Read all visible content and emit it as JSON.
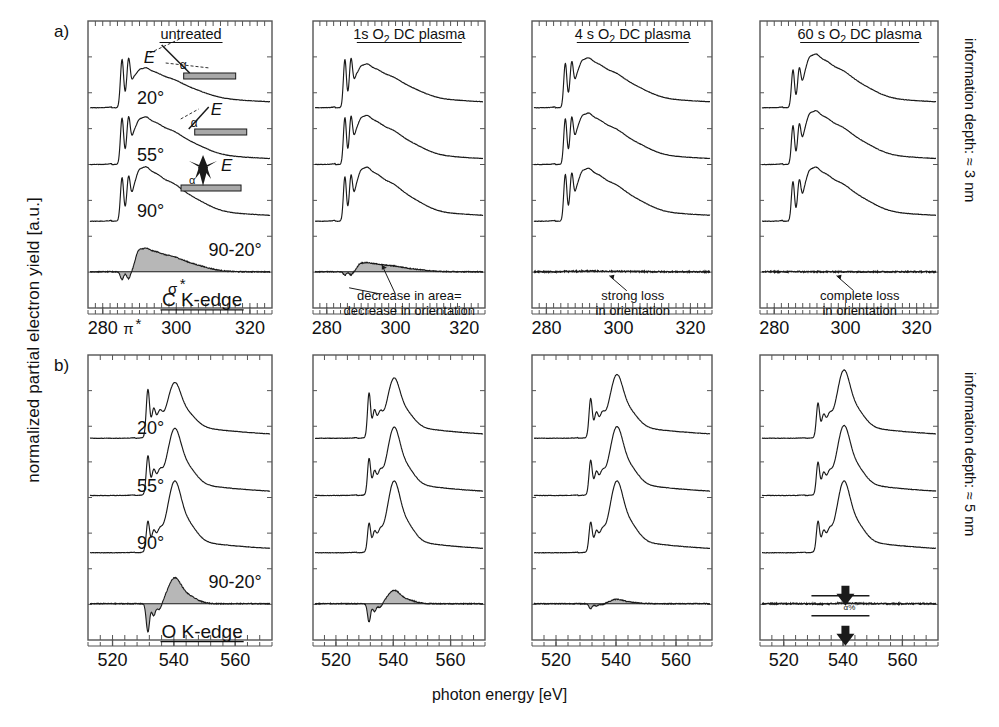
{
  "figure": {
    "ylabel": "normalized partial electron yield [a.u.]",
    "xlabel": "photon energy [eV]",
    "row_labels": {
      "a": "a)",
      "b": "b)"
    },
    "side_labels": {
      "row_a": "information depth: ≈ 3 nm",
      "row_b": "information depth: ≈ 5 nm"
    }
  },
  "chart_data": {
    "type": "line",
    "xlabel": "photon energy [eV]",
    "ylabel": "normalized partial electron yield [a.u.]",
    "grid": false,
    "legend": "none",
    "rows": [
      {
        "id": "a",
        "label": "a)",
        "edge": "C K-edge",
        "information_depth": "information depth: ≈ 3 nm",
        "xlim": [
          276,
          326
        ],
        "xticks": [
          280,
          300,
          320
        ],
        "xticklabels": [
          "280",
          "300",
          "320"
        ],
        "traces_per_panel": [
          "20°",
          "55°",
          "90°",
          "90-20°"
        ],
        "peak_labels": [
          "π*",
          "σ*"
        ],
        "panels": [
          {
            "title": "untreated",
            "title_parts": [
              {
                "t": "untreated",
                "sub": false
              }
            ],
            "annotation": "",
            "annotation_lines": [],
            "has_geometry_insets": true,
            "difference_area": "large"
          },
          {
            "title": "1s O2 DC plasma",
            "title_parts": [
              {
                "t": "1s O",
                "sub": false
              },
              {
                "t": "2",
                "sub": true
              },
              {
                "t": " DC plasma",
                "sub": false
              }
            ],
            "annotation": "decrease in area= decrease in orientation",
            "annotation_lines": [
              "decrease in area=",
              "decrease in orientation"
            ],
            "has_geometry_insets": false,
            "difference_area": "medium"
          },
          {
            "title": "4 s O2 DC plasma",
            "title_parts": [
              {
                "t": "4 s O",
                "sub": false
              },
              {
                "t": "2",
                "sub": true
              },
              {
                "t": " DC plasma",
                "sub": false
              }
            ],
            "annotation": "strong loss in orientation",
            "annotation_lines": [
              "strong loss",
              "in orientation"
            ],
            "has_geometry_insets": false,
            "difference_area": "small"
          },
          {
            "title": "60 s O2 DC plasma",
            "title_parts": [
              {
                "t": "60 s O",
                "sub": false
              },
              {
                "t": "2",
                "sub": true
              },
              {
                "t": " DC plasma",
                "sub": false
              }
            ],
            "annotation": "complete loss in orientation",
            "annotation_lines": [
              "complete loss",
              "in orientation"
            ],
            "has_geometry_insets": false,
            "difference_area": "none"
          }
        ]
      },
      {
        "id": "b",
        "label": "b)",
        "edge": "O K-edge",
        "information_depth": "information depth: ≈ 5 nm",
        "xlim": [
          512,
          572
        ],
        "xticks": [
          520,
          540,
          560
        ],
        "xticklabels": [
          "520",
          "540",
          "560"
        ],
        "traces_per_panel": [
          "20°",
          "55°",
          "90°",
          "90-20°"
        ],
        "peak_labels": [],
        "panels": [
          {
            "title": "untreated",
            "annotation": "",
            "annotation_lines": [],
            "difference_area": "large"
          },
          {
            "title": "1s O2 DC plasma",
            "annotation": "",
            "annotation_lines": [],
            "difference_area": "medium"
          },
          {
            "title": "4 s O2 DC plasma",
            "annotation": "",
            "annotation_lines": [],
            "difference_area": "small"
          },
          {
            "title": "60 s O2 DC plasma",
            "annotation": "",
            "annotation_lines": [],
            "difference_area": "tiny",
            "has_arrow_markers": true
          }
        ]
      }
    ],
    "geometry_insets": [
      {
        "angle_label": "20°",
        "vector_label": "E",
        "alpha_label": "α"
      },
      {
        "angle_label": "55°",
        "vector_label": "E",
        "alpha_label": "α"
      },
      {
        "angle_label": "90°",
        "vector_label": "E",
        "alpha_label": "α"
      }
    ],
    "colors": {
      "line": "#1a1a1a",
      "fill": "#b3b3b3",
      "frame": "#555555",
      "text": "#111111",
      "substrate": "#a8a8a8"
    }
  }
}
